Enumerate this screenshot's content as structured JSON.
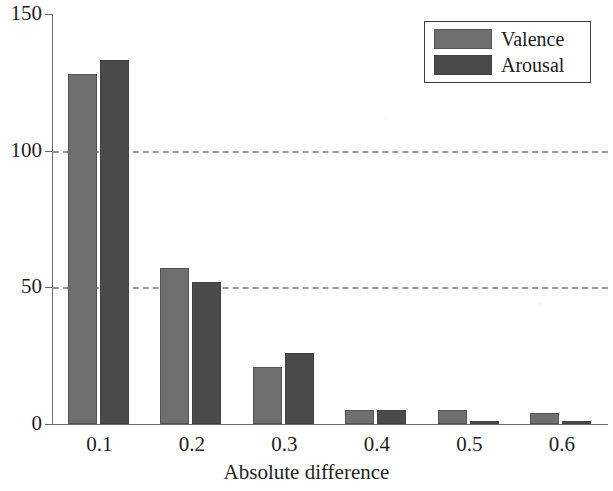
{
  "chart_data": {
    "type": "bar",
    "title": "",
    "xlabel": "Absolute difference",
    "ylabel": "",
    "categories": [
      "0.1",
      "0.2",
      "0.3",
      "0.4",
      "0.5",
      "0.6"
    ],
    "series": [
      {
        "name": "Valence",
        "color": "#6f6f6f",
        "values": [
          128,
          57,
          21,
          5,
          5,
          4
        ]
      },
      {
        "name": "Arousal",
        "color": "#4a4a4a",
        "values": [
          133,
          52,
          26,
          5,
          1,
          1
        ]
      }
    ],
    "ylim": [
      0,
      150
    ],
    "yticks": [
      0,
      50,
      100,
      150
    ],
    "ytick_labels": [
      "0",
      "50",
      "100",
      "150"
    ],
    "gridlines": {
      "y": [
        50,
        100
      ],
      "style": "dashed",
      "color": "#9a9a9a",
      "x": false
    },
    "legend": {
      "position": "top-right",
      "entries": [
        "Valence",
        "Arousal"
      ]
    }
  },
  "axes": {
    "y_tick_labels": [
      "150",
      "100",
      "50",
      "0"
    ],
    "x_tick_labels": [
      "0.1",
      "0.2",
      "0.3",
      "0.4",
      "0.5",
      "0.6"
    ],
    "x_axis_title": "Absolute difference"
  },
  "legend": {
    "entries": [
      {
        "label": "Valence",
        "color": "#6f6f6f"
      },
      {
        "label": "Arousal",
        "color": "#4a4a4a"
      }
    ]
  },
  "artifacts": {
    "bleed_left_bottom": "",
    "bleed_left_middle": "",
    "bleed_right_bottom": ""
  }
}
